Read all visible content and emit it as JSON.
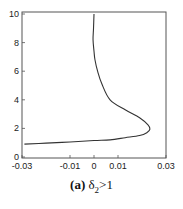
{
  "chart_data": {
    "type": "line",
    "title": "",
    "xlabel": "",
    "ylabel": "",
    "xlim": [
      -0.03,
      0.03
    ],
    "ylim": [
      0,
      10
    ],
    "grid": false,
    "x_ticks": [
      -0.03,
      -0.01,
      0,
      0.01,
      0.03
    ],
    "x_tick_labels": [
      "-0.03",
      "-0.01",
      "0",
      "0.01",
      "0.03"
    ],
    "y_ticks": [
      0,
      2,
      4,
      6,
      8,
      10
    ],
    "y_tick_labels": [
      "0",
      "2",
      "4",
      "6",
      "8",
      "10"
    ],
    "series": [
      {
        "name": "curve",
        "points": [
          [
            0.0,
            10.0
          ],
          [
            -0.0002,
            9.0
          ],
          [
            -0.0004,
            8.2
          ],
          [
            0.0,
            7.4
          ],
          [
            0.0004,
            6.8
          ],
          [
            0.0015,
            6.0
          ],
          [
            0.0033,
            5.1
          ],
          [
            0.0067,
            4.0
          ],
          [
            0.013,
            3.3
          ],
          [
            0.019,
            2.75
          ],
          [
            0.0225,
            2.25
          ],
          [
            0.0233,
            1.95
          ],
          [
            0.022,
            1.7
          ],
          [
            0.019,
            1.5
          ],
          [
            0.013,
            1.35
          ],
          [
            0.0067,
            1.2
          ],
          [
            0.0,
            1.15
          ],
          [
            -0.01,
            1.05
          ],
          [
            -0.02,
            0.97
          ],
          [
            -0.029,
            0.9
          ]
        ]
      }
    ]
  },
  "caption": {
    "label": "(a)",
    "symbol": "δ",
    "subscript": "2",
    "condition": ">1"
  }
}
